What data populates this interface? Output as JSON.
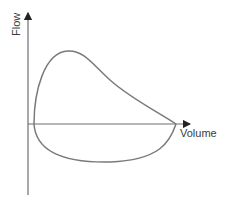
{
  "diagram": {
    "y_axis_label": "Flow",
    "x_axis_label": "Volume",
    "colors": {
      "axis": "#6e6e6e",
      "curve": "#7a7a7a",
      "text": "#3a3a3a"
    },
    "curve": {
      "description": "Closed flow-volume loop: expiratory limb above the volume axis with early peak flow then concave descent to zero; inspiratory limb below the axis as a rounded U-shaped curve",
      "segments": [
        "expiratory-limb",
        "inspiratory-limb"
      ]
    }
  }
}
